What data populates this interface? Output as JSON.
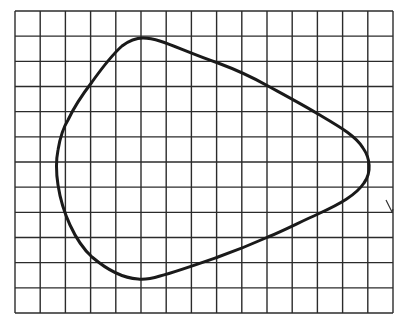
{
  "diagram": {
    "type": "closed-curve-on-grid",
    "grid": {
      "columns": 15,
      "rows": 12,
      "left": 15,
      "top": 11,
      "right": 393,
      "bottom": 313,
      "line_color": "#2b2b2b",
      "background": "#ffffff"
    },
    "curve": {
      "stroke_color": "#1a1a1a",
      "stroke_width": 3,
      "key_points": {
        "top": [
          143,
          38
        ],
        "right": [
          369,
          166
        ],
        "bottom": [
          140,
          279
        ],
        "left": [
          57,
          160
        ]
      }
    },
    "annotations": [
      {
        "label": "small check mark",
        "from": [
          386,
          200
        ],
        "to": [
          393,
          213
        ]
      }
    ]
  }
}
